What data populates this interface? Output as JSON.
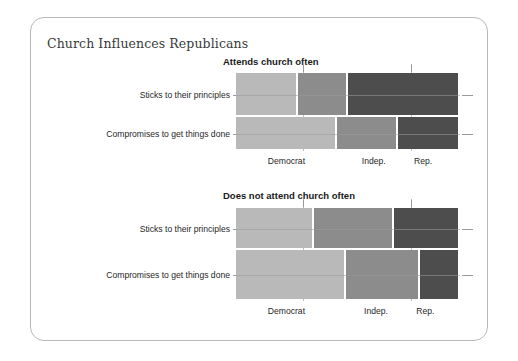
{
  "card": {
    "title": "Church Influences Republicans",
    "accent_color": "#b8b8b8"
  },
  "chart_data": {
    "type": "mosaic",
    "title": "Church Influences Republicans",
    "xlabel": "",
    "ylabel": "",
    "grid": false,
    "legend_position": "none",
    "categories": [
      "Democrat",
      "Indep.",
      "Rep."
    ],
    "row_categories": [
      "Sticks to their principles",
      "Compromises to get things done"
    ],
    "cell_colors": {
      "Democrat": "#b9b9b9",
      "Indep.": "#8c8c8c",
      "Rep.": "#4d4d4d"
    },
    "panels": [
      {
        "label": "Attends church often",
        "rows": [
          {
            "label": "Sticks to their principles",
            "height_frac": 0.565,
            "cells": [
              {
                "category": "Democrat",
                "width_frac": 0.275,
                "color": "#b9b9b9"
              },
              {
                "category": "Indep.",
                "width_frac": 0.225,
                "color": "#8c8c8c"
              },
              {
                "category": "Rep.",
                "width_frac": 0.5,
                "color": "#4d4d4d"
              }
            ]
          },
          {
            "label": "Compromises to get things done",
            "height_frac": 0.435,
            "cells": [
              {
                "category": "Democrat",
                "width_frac": 0.45,
                "color": "#b9b9b9"
              },
              {
                "category": "Indep.",
                "width_frac": 0.272,
                "color": "#8c8c8c"
              },
              {
                "category": "Rep.",
                "width_frac": 0.278,
                "color": "#4d4d4d"
              }
            ]
          }
        ],
        "column_label_positions": [
          0.225,
          0.615,
          0.835
        ]
      },
      {
        "label": "Does not attend church often",
        "rows": [
          {
            "label": "Sticks to their principles",
            "height_frac": 0.45,
            "cells": [
              {
                "category": "Democrat",
                "width_frac": 0.35,
                "color": "#b9b9b9"
              },
              {
                "category": "Indep.",
                "width_frac": 0.355,
                "color": "#8c8c8c"
              },
              {
                "category": "Rep.",
                "width_frac": 0.295,
                "color": "#4d4d4d"
              }
            ]
          },
          {
            "label": "Compromises to get things done",
            "height_frac": 0.55,
            "cells": [
              {
                "category": "Democrat",
                "width_frac": 0.49,
                "color": "#b9b9b9"
              },
              {
                "category": "Indep.",
                "width_frac": 0.33,
                "color": "#8c8c8c"
              },
              {
                "category": "Rep.",
                "width_frac": 0.18,
                "color": "#4d4d4d"
              }
            ]
          }
        ],
        "column_label_positions": [
          0.225,
          0.625,
          0.845
        ]
      }
    ]
  }
}
